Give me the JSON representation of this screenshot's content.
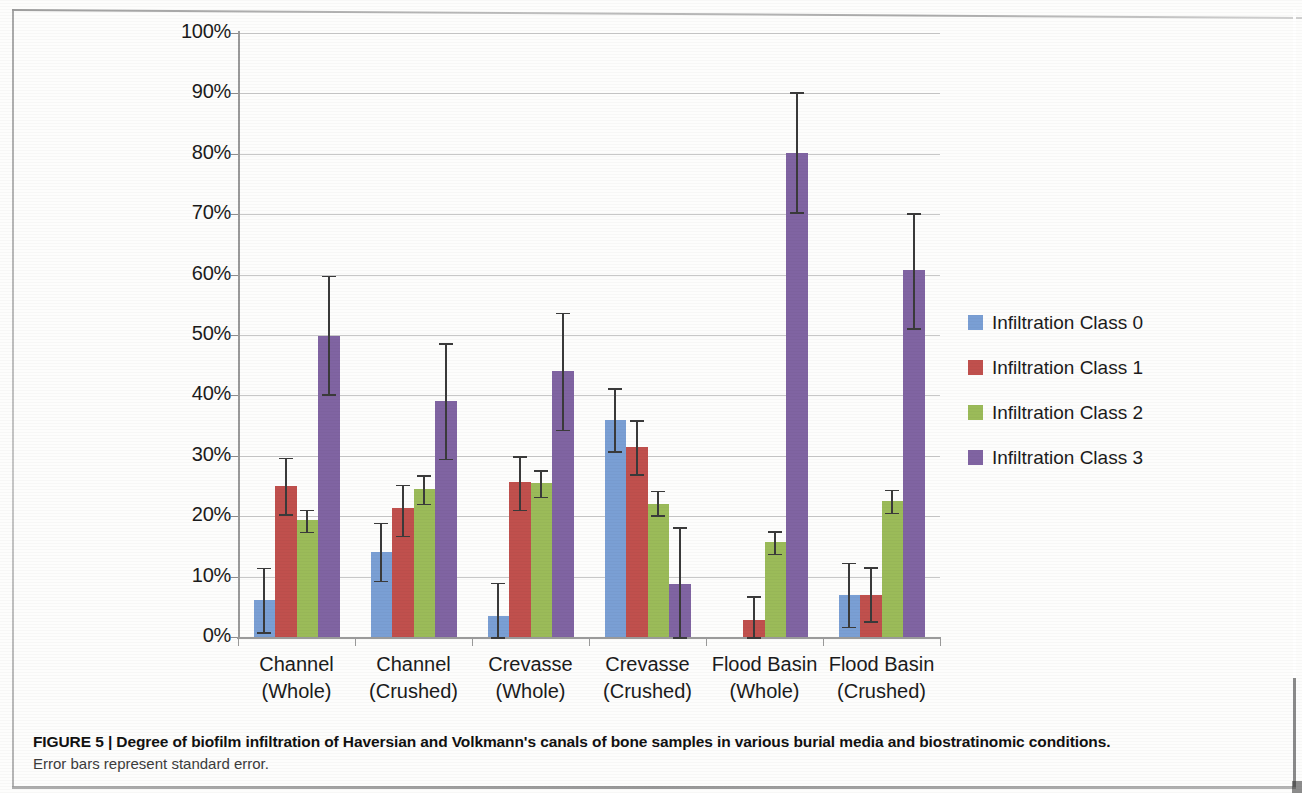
{
  "caption": {
    "figure_label": "FIGURE 5 | ",
    "title": "Degree of biofilm infiltration of Haversian and Volkmann's canals of bone samples in various burial media and biostratinomic conditions.",
    "subtitle": "Error bars represent standard error."
  },
  "legend": {
    "position": "right",
    "items": [
      {
        "label": "Infiltration Class 0",
        "color": "#7a9fd4"
      },
      {
        "label": "Infiltration Class 1",
        "color": "#c0504d"
      },
      {
        "label": "Infiltration Class 2",
        "color": "#9bbb59"
      },
      {
        "label": "Infiltration Class 3",
        "color": "#8064a2"
      }
    ]
  },
  "chart_data": {
    "type": "bar",
    "title": "",
    "xlabel": "",
    "ylabel": "",
    "ylim": [
      0,
      100
    ],
    "ytick_values": [
      0,
      10,
      20,
      30,
      40,
      50,
      60,
      70,
      80,
      90,
      100
    ],
    "ytick_labels": [
      "0%",
      "10%",
      "20%",
      "30%",
      "40%",
      "50%",
      "60%",
      "70%",
      "80%",
      "90%",
      "100%"
    ],
    "grid": true,
    "units": "percent",
    "error_bars": "standard error",
    "categories": [
      [
        "Channel",
        "(Whole)"
      ],
      [
        "Channel",
        "(Crushed)"
      ],
      [
        "Crevasse",
        "(Whole)"
      ],
      [
        "Crevasse",
        "(Crushed)"
      ],
      [
        "Flood Basin",
        "(Whole)"
      ],
      [
        "Flood Basin",
        "(Crushed)"
      ]
    ],
    "series": [
      {
        "name": "Infiltration Class 0",
        "color": "#7a9fd4",
        "values": [
          6.2,
          14.1,
          3.4,
          36.0,
          0.0,
          7.0
        ],
        "err_low": [
          0.8,
          9.3,
          0.0,
          30.8,
          0.0,
          1.7
        ],
        "err_high": [
          11.5,
          18.9,
          9.0,
          41.2,
          0.0,
          12.3
        ]
      },
      {
        "name": "Infiltration Class 1",
        "color": "#c0504d",
        "values": [
          25.0,
          21.4,
          25.7,
          31.4,
          2.8,
          7.0
        ],
        "err_low": [
          20.3,
          16.8,
          21.1,
          27.0,
          0.0,
          2.6
        ],
        "err_high": [
          29.7,
          25.2,
          29.9,
          35.9,
          6.8,
          11.6
        ]
      },
      {
        "name": "Infiltration Class 2",
        "color": "#9bbb59",
        "values": [
          19.4,
          24.5,
          25.5,
          22.0,
          15.7,
          22.5
        ],
        "err_low": [
          17.4,
          22.1,
          23.2,
          20.2,
          13.8,
          20.6
        ],
        "err_high": [
          21.1,
          26.8,
          27.6,
          24.2,
          17.5,
          24.4
        ]
      },
      {
        "name": "Infiltration Class 3",
        "color": "#8064a2",
        "values": [
          49.9,
          39.0,
          44.0,
          8.7,
          80.2,
          60.8
        ],
        "err_low": [
          40.2,
          29.5,
          34.3,
          0.0,
          70.3,
          51.1
        ],
        "err_high": [
          59.8,
          48.6,
          53.7,
          18.2,
          90.2,
          70.2
        ]
      }
    ]
  }
}
